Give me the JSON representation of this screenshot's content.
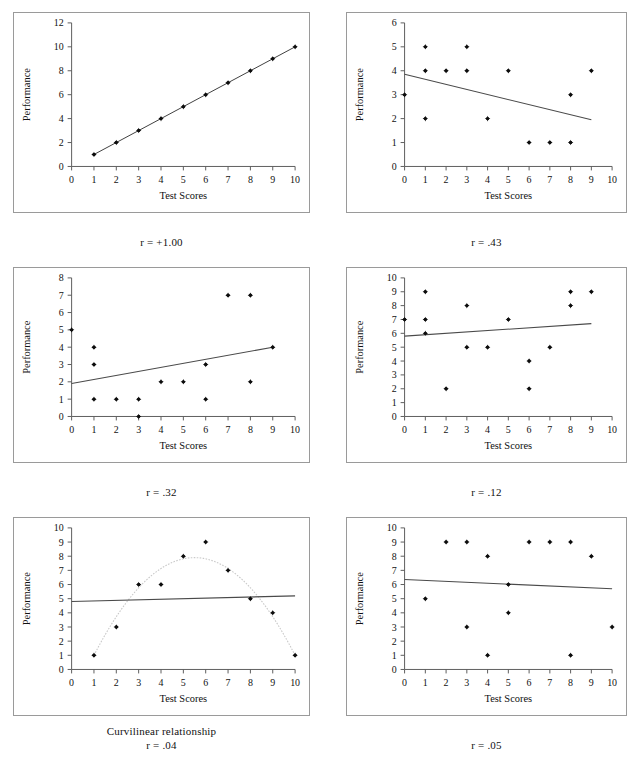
{
  "page": {
    "background": "#ffffff",
    "axis_color": "#5d5d5d",
    "marker_color": "#0d0d0d",
    "fitline_color": "#4a4a4a",
    "curve_color": "#c9c9c9",
    "panel_border_color": "#9a9a9a"
  },
  "chart_data": [
    {
      "id": "chart-r-plus-1",
      "type": "scatter",
      "title": "",
      "xlabel": "Test Scores",
      "ylabel": "Performance",
      "xlim": [
        0,
        10
      ],
      "ylim": [
        0,
        12
      ],
      "xticks": [
        0,
        1,
        2,
        3,
        4,
        5,
        6,
        7,
        8,
        9,
        10
      ],
      "yticks": [
        0,
        2,
        4,
        6,
        8,
        10,
        12
      ],
      "grid": false,
      "points": [
        [
          1,
          1
        ],
        [
          2,
          2
        ],
        [
          3,
          3
        ],
        [
          4,
          4
        ],
        [
          5,
          5
        ],
        [
          6,
          6
        ],
        [
          7,
          7
        ],
        [
          8,
          8
        ],
        [
          9,
          9
        ],
        [
          10,
          10
        ]
      ],
      "connector": [
        [
          1,
          1
        ],
        [
          10,
          10
        ]
      ],
      "fitline": null,
      "curve": null,
      "caption": "r = +1.00",
      "caption_sub": ""
    },
    {
      "id": "chart-r-43",
      "type": "scatter",
      "title": "",
      "xlabel": "Test Scores",
      "ylabel": "Performance",
      "xlim": [
        0,
        10
      ],
      "ylim": [
        0,
        6
      ],
      "xticks": [
        0,
        1,
        2,
        3,
        4,
        5,
        6,
        7,
        8,
        9,
        10
      ],
      "yticks": [
        0,
        1,
        2,
        3,
        4,
        5,
        6
      ],
      "grid": false,
      "points": [
        [
          0,
          3
        ],
        [
          1,
          5
        ],
        [
          1,
          4
        ],
        [
          1,
          2
        ],
        [
          2,
          4
        ],
        [
          3,
          5
        ],
        [
          3,
          4
        ],
        [
          4,
          2
        ],
        [
          5,
          4
        ],
        [
          6,
          1
        ],
        [
          7,
          1
        ],
        [
          8,
          3
        ],
        [
          8,
          1
        ],
        [
          9,
          4
        ]
      ],
      "connector": null,
      "fitline": [
        [
          0,
          3.85
        ],
        [
          9,
          1.95
        ]
      ],
      "curve": null,
      "caption": "r = .43",
      "caption_sub": ""
    },
    {
      "id": "chart-r-32",
      "type": "scatter",
      "title": "",
      "xlabel": "Test Scores",
      "ylabel": "Performance",
      "xlim": [
        0,
        10
      ],
      "ylim": [
        0,
        8
      ],
      "xticks": [
        0,
        1,
        2,
        3,
        4,
        5,
        6,
        7,
        8,
        9,
        10
      ],
      "yticks": [
        0,
        1,
        2,
        3,
        4,
        5,
        6,
        7,
        8
      ],
      "grid": false,
      "points": [
        [
          0,
          5
        ],
        [
          1,
          4
        ],
        [
          1,
          3
        ],
        [
          1,
          1
        ],
        [
          2,
          1
        ],
        [
          3,
          1
        ],
        [
          3,
          0
        ],
        [
          4,
          2
        ],
        [
          5,
          2
        ],
        [
          6,
          3
        ],
        [
          6,
          1
        ],
        [
          7,
          7
        ],
        [
          8,
          7
        ],
        [
          8,
          2
        ],
        [
          9,
          4
        ]
      ],
      "connector": null,
      "fitline": [
        [
          0,
          1.9
        ],
        [
          9,
          4.0
        ]
      ],
      "curve": null,
      "caption": "r = .32",
      "caption_sub": ""
    },
    {
      "id": "chart-r-12",
      "type": "scatter",
      "title": "",
      "xlabel": "Test Scores",
      "ylabel": "Performance",
      "xlim": [
        0,
        10
      ],
      "ylim": [
        0,
        10
      ],
      "xticks": [
        0,
        1,
        2,
        3,
        4,
        5,
        6,
        7,
        8,
        9,
        10
      ],
      "yticks": [
        0,
        1,
        2,
        3,
        4,
        5,
        6,
        7,
        8,
        9,
        10
      ],
      "grid": false,
      "points": [
        [
          0,
          7
        ],
        [
          1,
          9
        ],
        [
          1,
          7
        ],
        [
          1,
          6
        ],
        [
          2,
          2
        ],
        [
          3,
          8
        ],
        [
          3,
          5
        ],
        [
          4,
          5
        ],
        [
          5,
          7
        ],
        [
          6,
          4
        ],
        [
          6,
          2
        ],
        [
          7,
          5
        ],
        [
          8,
          9
        ],
        [
          8,
          8
        ],
        [
          9,
          9
        ]
      ],
      "connector": null,
      "fitline": [
        [
          0,
          5.8
        ],
        [
          9,
          6.7
        ]
      ],
      "curve": null,
      "caption": "r = .12",
      "caption_sub": ""
    },
    {
      "id": "chart-curvilinear",
      "type": "scatter",
      "title": "",
      "xlabel": "Test Scores",
      "ylabel": "Performance",
      "xlim": [
        0,
        10
      ],
      "ylim": [
        0,
        10
      ],
      "xticks": [
        0,
        1,
        2,
        3,
        4,
        5,
        6,
        7,
        8,
        9,
        10
      ],
      "yticks": [
        0,
        1,
        2,
        3,
        4,
        5,
        6,
        7,
        8,
        9,
        10
      ],
      "grid": false,
      "points": [
        [
          1,
          1
        ],
        [
          2,
          3
        ],
        [
          3,
          6
        ],
        [
          4,
          6
        ],
        [
          5,
          8
        ],
        [
          6,
          9
        ],
        [
          7,
          7
        ],
        [
          8,
          5
        ],
        [
          9,
          4
        ],
        [
          10,
          1
        ]
      ],
      "connector": null,
      "fitline": [
        [
          0,
          4.8
        ],
        [
          10,
          5.2
        ]
      ],
      "curve": {
        "vertex_x": 5.5,
        "vertex_y": 7.9,
        "x_start": 1,
        "x_end": 10,
        "y_start": 1,
        "y_end": 1
      },
      "caption": "r = .04",
      "caption_sub": "Curvilinear relationship"
    },
    {
      "id": "chart-r-05",
      "type": "scatter",
      "title": "",
      "xlabel": "Test Scores",
      "ylabel": "Performance",
      "xlim": [
        0,
        10
      ],
      "ylim": [
        0,
        10
      ],
      "xticks": [
        0,
        1,
        2,
        3,
        4,
        5,
        6,
        7,
        8,
        9,
        10
      ],
      "yticks": [
        0,
        1,
        2,
        3,
        4,
        5,
        6,
        7,
        8,
        9,
        10
      ],
      "grid": false,
      "points": [
        [
          1,
          5
        ],
        [
          2,
          9
        ],
        [
          3,
          9
        ],
        [
          3,
          3
        ],
        [
          4,
          8
        ],
        [
          4,
          1
        ],
        [
          5,
          6
        ],
        [
          5,
          4
        ],
        [
          6,
          9
        ],
        [
          7,
          9
        ],
        [
          8,
          9
        ],
        [
          8,
          1
        ],
        [
          9,
          8
        ],
        [
          10,
          3
        ]
      ],
      "connector": null,
      "fitline": [
        [
          0,
          6.35
        ],
        [
          10,
          5.7
        ]
      ],
      "curve": null,
      "caption": "r = .05",
      "caption_sub": ""
    }
  ]
}
